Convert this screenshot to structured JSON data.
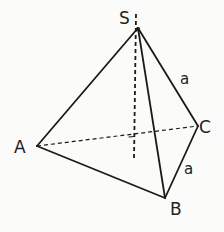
{
  "diagram": {
    "type": "tetrahedron",
    "vertices": {
      "S": {
        "label": "S",
        "x": 138,
        "y": 28
      },
      "A": {
        "label": "A",
        "x": 37,
        "y": 146
      },
      "B": {
        "label": "B",
        "x": 165,
        "y": 198
      },
      "C": {
        "label": "C",
        "x": 198,
        "y": 126
      }
    },
    "edges": [
      {
        "from": "S",
        "to": "A",
        "style": "solid"
      },
      {
        "from": "S",
        "to": "B",
        "style": "solid"
      },
      {
        "from": "S",
        "to": "C",
        "style": "solid",
        "label": "a"
      },
      {
        "from": "A",
        "to": "B",
        "style": "solid"
      },
      {
        "from": "B",
        "to": "C",
        "style": "solid",
        "label": "a"
      },
      {
        "from": "A",
        "to": "C",
        "style": "dashed"
      }
    ],
    "height_line": {
      "style": "dashed",
      "from_y": 14,
      "to_y": 160,
      "x": 134
    },
    "labels": {
      "S": "S",
      "A": "A",
      "B": "B",
      "C": "C",
      "edge_SC": "a",
      "edge_BC": "a"
    }
  }
}
